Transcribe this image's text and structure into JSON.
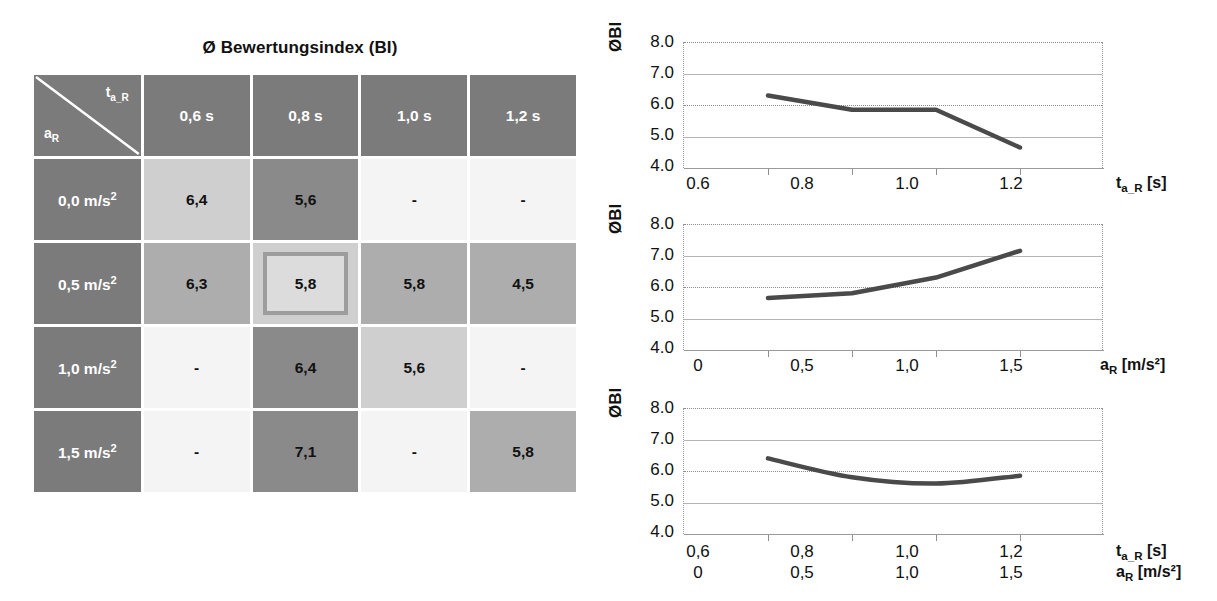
{
  "matrix": {
    "title": "Ø Bewertungsindex (BI)",
    "corner": {
      "col_var": "t",
      "col_var_sub": "a_R",
      "row_var": "a",
      "row_var_sub": "R"
    },
    "column_headers": [
      "0,6 s",
      "0,8 s",
      "1,0 s",
      "1,2 s"
    ],
    "row_headers": [
      "0,0 m/s²",
      "0,5 m/s²",
      "1,0 m/s²",
      "1,5 m/s²"
    ],
    "rows": [
      {
        "header": "0,0 m/s²",
        "cells": [
          {
            "value": "6,4",
            "shade": "sh-light",
            "highlighted": false
          },
          {
            "value": "5,6",
            "shade": "sh-dark",
            "highlighted": false
          },
          {
            "value": "-",
            "shade": "sh-white",
            "highlighted": false
          },
          {
            "value": "-",
            "shade": "sh-white",
            "highlighted": false
          }
        ]
      },
      {
        "header": "0,5 m/s²",
        "cells": [
          {
            "value": "6,3",
            "shade": "sh-mid",
            "highlighted": false
          },
          {
            "value": "5,8",
            "shade": "sh-light",
            "highlighted": true
          },
          {
            "value": "5,8",
            "shade": "sh-mid",
            "highlighted": false
          },
          {
            "value": "4,5",
            "shade": "sh-mid",
            "highlighted": false
          }
        ]
      },
      {
        "header": "1,0 m/s²",
        "cells": [
          {
            "value": "-",
            "shade": "sh-white",
            "highlighted": false
          },
          {
            "value": "6,4",
            "shade": "sh-dark",
            "highlighted": false
          },
          {
            "value": "5,6",
            "shade": "sh-light",
            "highlighted": false
          },
          {
            "value": "-",
            "shade": "sh-white",
            "highlighted": false
          }
        ]
      },
      {
        "header": "1,5 m/s²",
        "cells": [
          {
            "value": "-",
            "shade": "sh-white",
            "highlighted": false
          },
          {
            "value": "7,1",
            "shade": "sh-dark",
            "highlighted": false
          },
          {
            "value": "-",
            "shade": "sh-white",
            "highlighted": false
          },
          {
            "value": "5,8",
            "shade": "sh-mid",
            "highlighted": false
          }
        ]
      }
    ]
  },
  "chart_data": [
    {
      "id": "chart-ta",
      "type": "line",
      "title": "",
      "ylabel": "ØBI",
      "xlabel": "t_a_R [s]",
      "xlabel_main": "t",
      "xlabel_sub": "a_R",
      "xlabel_unit": "[s]",
      "categories": [
        "0.6",
        "0.8",
        "1.0",
        "1.2"
      ],
      "x": [
        0.6,
        0.8,
        1.0,
        1.2
      ],
      "values": [
        6.3,
        5.85,
        5.85,
        4.65
      ],
      "ylim": [
        4.0,
        8.0
      ],
      "yticks": [
        "8.0",
        "7.0",
        "6.0",
        "5.0",
        "4.0"
      ],
      "ytickvals": [
        8.0,
        7.0,
        6.0,
        5.0,
        4.0
      ],
      "xlim": [
        0.5,
        1.3
      ],
      "grid": true,
      "legend": "none"
    },
    {
      "id": "chart-ar",
      "type": "line",
      "title": "",
      "ylabel": "ØBI",
      "xlabel": "a_R [m/s²]",
      "xlabel_main": "a",
      "xlabel_sub": "R",
      "xlabel_unit": "[m/s²]",
      "categories": [
        "0",
        "0,5",
        "1,0",
        "1,5"
      ],
      "x": [
        0.0,
        0.5,
        1.0,
        1.5
      ],
      "values": [
        5.65,
        5.8,
        6.3,
        7.15
      ],
      "ylim": [
        4.0,
        8.0
      ],
      "yticks": [
        "8.0",
        "7.0",
        "6.0",
        "5.0",
        "4.0"
      ],
      "ytickvals": [
        8.0,
        7.0,
        6.0,
        5.0,
        4.0
      ],
      "xlim": [
        -0.25,
        1.75
      ],
      "grid": true,
      "legend": "none"
    },
    {
      "id": "chart-combined",
      "type": "line",
      "title": "",
      "ylabel": "ØBI",
      "xlabel_row1": "t_a_R [s]",
      "xlabel_row1_main": "t",
      "xlabel_row1_sub": "a_R",
      "xlabel_row1_unit": "[s]",
      "xlabel_row2": "a_R [m/s²]",
      "xlabel_row2_main": "a",
      "xlabel_row2_sub": "R",
      "xlabel_row2_unit": "[m/s²]",
      "categories_row1": [
        "0,6",
        "0,8",
        "1,0",
        "1,2"
      ],
      "categories_row2": [
        "0",
        "0,5",
        "1,0",
        "1,5"
      ],
      "x": [
        1,
        2,
        3,
        4
      ],
      "values": [
        6.4,
        5.8,
        5.6,
        5.85
      ],
      "ylim": [
        4.0,
        8.0
      ],
      "yticks": [
        "8.0",
        "7.0",
        "6.0",
        "5.0",
        "4.0"
      ],
      "ytickvals": [
        8.0,
        7.0,
        6.0,
        5.0,
        4.0
      ],
      "grid": true,
      "legend": "none"
    }
  ],
  "colors": {
    "header_gray": "#7b7b7b",
    "shade_dark": "#8a8a8a",
    "shade_mid": "#adadad",
    "shade_light": "#cfcfcf",
    "shade_white": "#f4f4f4",
    "highlight_border": "#9d9d9d",
    "line_color": "#4a4a4a",
    "grid_color": "#8c8c8c",
    "text": "#111111"
  }
}
